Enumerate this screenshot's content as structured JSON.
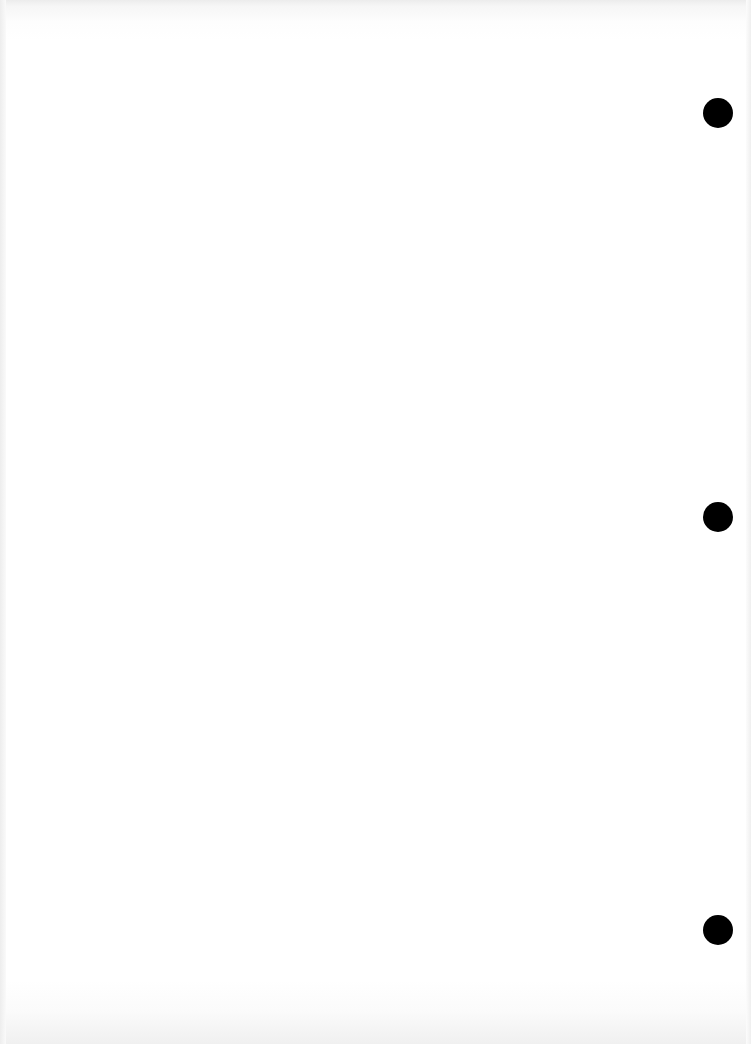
{
  "page": {
    "type": "blank scanned page",
    "background_color": "#ffffff",
    "text": ""
  },
  "punch_holes": [
    {
      "cx": 718,
      "cy": 113,
      "diameter": 30,
      "color": "#000000"
    },
    {
      "cx": 718,
      "cy": 517,
      "diameter": 30,
      "color": "#000000"
    },
    {
      "cx": 718,
      "cy": 930,
      "diameter": 30,
      "color": "#000000"
    }
  ]
}
